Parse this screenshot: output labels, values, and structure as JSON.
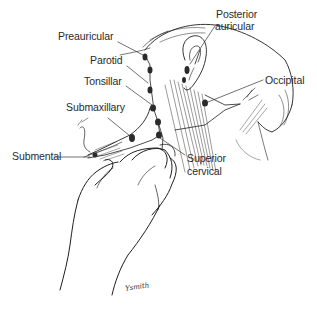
{
  "figure": {
    "labels": [
      {
        "id": "preauricular",
        "text": "Preauricular",
        "x": 58,
        "y": 31
      },
      {
        "id": "posterior-auricular-1",
        "text": "Posterior",
        "x": 216,
        "y": 9
      },
      {
        "id": "posterior-auricular-2",
        "text": "auricular",
        "x": 215,
        "y": 21
      },
      {
        "id": "parotid",
        "text": "Parotid",
        "x": 90,
        "y": 55
      },
      {
        "id": "occipital",
        "text": "Occipital",
        "x": 265,
        "y": 75
      },
      {
        "id": "tonsillar",
        "text": "Tonsillar",
        "x": 84,
        "y": 76
      },
      {
        "id": "submaxillary",
        "text": "Submaxillary",
        "x": 66,
        "y": 102
      },
      {
        "id": "submental",
        "text": "Submental",
        "x": 12,
        "y": 151
      },
      {
        "id": "superior-cervical-1",
        "text": "Superior",
        "x": 187,
        "y": 153
      },
      {
        "id": "superior-cervical-2",
        "text": "cervical",
        "x": 187,
        "y": 166
      }
    ],
    "signature": "Ysmith",
    "colors": {
      "ink": "#1f1f1f",
      "node": "#2b2b2b",
      "background": "#ffffff"
    }
  }
}
